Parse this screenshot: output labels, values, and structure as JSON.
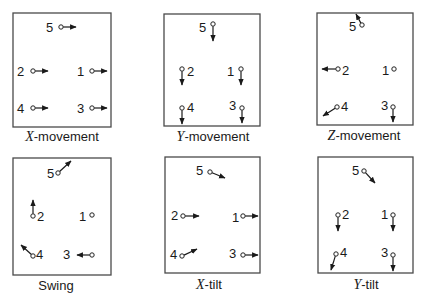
{
  "figure": {
    "panels": [
      {
        "id": "x-movement",
        "caption_var": "X",
        "caption_rest": "-movement",
        "frame": {
          "x": 13,
          "y": 13,
          "w": 98,
          "h": 114
        },
        "caption_pos": {
          "x": 62,
          "y": 141
        },
        "markers": [
          {
            "n": "5",
            "label": [
              46,
              32
            ],
            "c": [
              61,
              27
            ],
            "a": [
              76,
              27
            ]
          },
          {
            "n": "2",
            "label": [
              17,
              76
            ],
            "c": [
              33,
              71
            ],
            "a": [
              48,
              71
            ]
          },
          {
            "n": "1",
            "label": [
              77,
              76
            ],
            "c": [
              92,
              71
            ],
            "a": [
              107,
              71
            ]
          },
          {
            "n": "4",
            "label": [
              17,
              113
            ],
            "c": [
              33,
              108
            ],
            "a": [
              48,
              108
            ]
          },
          {
            "n": "3",
            "label": [
              77,
              113
            ],
            "c": [
              92,
              108
            ],
            "a": [
              107,
              108
            ]
          }
        ]
      },
      {
        "id": "y-movement",
        "caption_var": "Y",
        "caption_rest": "-movement",
        "frame": {
          "x": 164,
          "y": 14,
          "w": 96,
          "h": 112
        },
        "caption_pos": {
          "x": 213,
          "y": 141
        },
        "markers": [
          {
            "n": "5",
            "label": [
              199,
              32
            ],
            "c": [
              213,
              24
            ],
            "a": [
              213,
              41
            ]
          },
          {
            "n": "2",
            "label": [
              187,
              76
            ],
            "c": [
              182,
              69
            ],
            "a": [
              182,
              85
            ]
          },
          {
            "n": "1",
            "label": [
              227,
              76
            ],
            "c": [
              241,
              69
            ],
            "a": [
              241,
              85
            ]
          },
          {
            "n": "4",
            "label": [
              187,
              112
            ],
            "c": [
              182,
              108
            ],
            "a": [
              182,
              124
            ]
          },
          {
            "n": "3",
            "label": [
              229,
              110
            ],
            "c": [
              242,
              108
            ],
            "a": [
              242,
              123
            ]
          }
        ]
      },
      {
        "id": "z-movement",
        "caption_var": "Z",
        "caption_rest": "-movement",
        "frame": {
          "x": 317,
          "y": 13,
          "w": 96,
          "h": 112
        },
        "caption_pos": {
          "x": 364,
          "y": 140
        },
        "markers": [
          {
            "n": "5",
            "label": [
              349,
              31
            ],
            "c": [
              362,
              25
            ],
            "a": [
              356,
              14
            ]
          },
          {
            "n": "2",
            "label": [
              342,
              75
            ],
            "c": [
              338,
              69
            ],
            "a": [
              322,
              69
            ]
          },
          {
            "n": "1",
            "label": [
              382,
              75
            ],
            "c": [
              394,
              69
            ],
            "a": null
          },
          {
            "n": "4",
            "label": [
              341,
              111
            ],
            "c": [
              337,
              107
            ],
            "a": [
              323,
              116
            ]
          },
          {
            "n": "3",
            "label": [
              381,
              110
            ],
            "c": [
              393,
              107
            ],
            "a": [
              393,
              122
            ]
          }
        ]
      },
      {
        "id": "swing",
        "caption_var": "",
        "caption_rest": "Swing",
        "frame": {
          "x": 13,
          "y": 158,
          "w": 98,
          "h": 117
        },
        "caption_pos": {
          "x": 56,
          "y": 290
        },
        "markers": [
          {
            "n": "5",
            "label": [
              47,
              178
            ],
            "c": [
              58,
              173
            ],
            "a": [
              71,
              161
            ]
          },
          {
            "n": "2",
            "label": [
              37,
              221
            ],
            "c": [
              33,
              216
            ],
            "a": [
              33,
              200
            ]
          },
          {
            "n": "1",
            "label": [
              79,
              221
            ],
            "c": [
              92,
              215
            ],
            "a": null
          },
          {
            "n": "4",
            "label": [
              36,
              259
            ],
            "c": [
              33,
              256
            ],
            "a": [
              21,
              245
            ]
          },
          {
            "n": "3",
            "label": [
              63,
              259
            ],
            "c": [
              92,
              255
            ],
            "a": [
              77,
              255
            ]
          }
        ]
      },
      {
        "id": "x-tilt",
        "caption_var": "X",
        "caption_rest": "-tilt",
        "frame": {
          "x": 165,
          "y": 157,
          "w": 95,
          "h": 116
        },
        "caption_pos": {
          "x": 209,
          "y": 289
        },
        "markers": [
          {
            "n": "5",
            "label": [
              196,
              175
            ],
            "c": [
              210,
              172
            ],
            "a": [
              225,
              178
            ]
          },
          {
            "n": "2",
            "label": [
              171,
              220
            ],
            "c": [
              183,
              216
            ],
            "a": [
              199,
              216
            ]
          },
          {
            "n": "1",
            "label": [
              232,
              222
            ],
            "c": [
              243,
              216
            ],
            "a": [
              258,
              216
            ]
          },
          {
            "n": "4",
            "label": [
              170,
              259
            ],
            "c": [
              182,
              256
            ],
            "a": [
              197,
              249
            ]
          },
          {
            "n": "3",
            "label": [
              229,
              258
            ],
            "c": [
              243,
              255
            ],
            "a": [
              258,
              255
            ]
          }
        ]
      },
      {
        "id": "y-tilt",
        "caption_var": "Y",
        "caption_rest": "-tilt",
        "frame": {
          "x": 318,
          "y": 157,
          "w": 95,
          "h": 116
        },
        "caption_pos": {
          "x": 366,
          "y": 289
        },
        "markers": [
          {
            "n": "5",
            "label": [
              352,
              175
            ],
            "c": [
              364,
              171
            ],
            "a": [
              375,
              183
            ]
          },
          {
            "n": "2",
            "label": [
              342,
              219
            ],
            "c": [
              338,
              215
            ],
            "a": [
              338,
              231
            ]
          },
          {
            "n": "1",
            "label": [
              381,
              219
            ],
            "c": [
              393,
              215
            ],
            "a": [
              393,
              231
            ]
          },
          {
            "n": "4",
            "label": [
              340,
              257
            ],
            "c": [
              336,
              254
            ],
            "a": [
              331,
              270
            ]
          },
          {
            "n": "3",
            "label": [
              381,
              257
            ],
            "c": [
              393,
              255
            ],
            "a": [
              393,
              271
            ]
          }
        ]
      }
    ]
  }
}
